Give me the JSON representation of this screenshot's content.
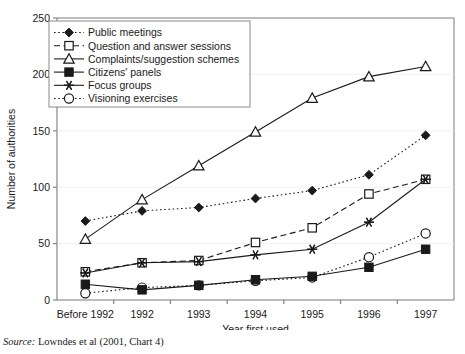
{
  "chart_data": {
    "type": "line",
    "title": "",
    "xlabel": "Year first used",
    "ylabel": "Number of authorities",
    "categories": [
      "Before 1992",
      "1992",
      "1993",
      "1994",
      "1995",
      "1996",
      "1997"
    ],
    "ylim": [
      0,
      250
    ],
    "yticks": [
      0,
      50,
      100,
      150,
      200,
      250
    ],
    "grid": false,
    "legend_position": "top-left",
    "series": [
      {
        "name": "Public meetings",
        "marker": "filled-diamond",
        "linestyle": "dotted",
        "color": "#1a1a1a",
        "values": [
          70,
          79,
          82,
          90,
          97,
          111,
          146
        ]
      },
      {
        "name": "Question and answer sessions",
        "marker": "open-square",
        "linestyle": "dashed",
        "color": "#1a1a1a",
        "values": [
          25,
          33,
          35,
          51,
          64,
          94,
          107
        ]
      },
      {
        "name": "Complaints/suggestion schemes",
        "marker": "open-triangle",
        "linestyle": "solid",
        "color": "#1a1a1a",
        "values": [
          54,
          89,
          119,
          149,
          179,
          198,
          207
        ]
      },
      {
        "name": "Citizens' panels",
        "marker": "filled-square",
        "linestyle": "solid",
        "color": "#1a1a1a",
        "values": [
          14,
          9,
          13,
          18,
          21,
          29,
          45
        ]
      },
      {
        "name": "Focus groups",
        "marker": "star",
        "linestyle": "solid",
        "color": "#1a1a1a",
        "values": [
          24,
          33,
          34,
          40,
          45,
          69,
          107
        ]
      },
      {
        "name": "Visioning exercises",
        "marker": "open-circle",
        "linestyle": "dotted",
        "color": "#1a1a1a",
        "values": [
          6,
          11,
          13,
          17,
          20,
          38,
          59
        ]
      }
    ]
  },
  "source": {
    "prefix": "Source:",
    "text": "Lowndes et al (2001, Chart 4)"
  }
}
